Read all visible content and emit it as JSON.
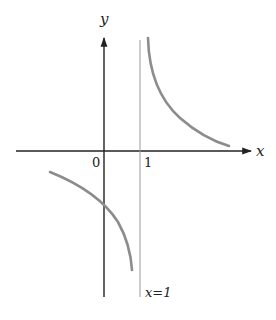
{
  "figure": {
    "axes": {
      "x_label": "x",
      "y_label": "y",
      "origin_label": "0",
      "tick_labels": [
        "1"
      ]
    },
    "asymptote": {
      "label": "x=1",
      "x": 1
    },
    "curve": {
      "description": "Hyperbola-like graph with vertical asymptote x = 1; right branch decreasing toward x-axis for x>1, left branch decreasing to -infinity as x approaches 1 from left",
      "color": "#8c8c8c"
    },
    "colors": {
      "axis": "#222222",
      "asymptote": "#9a9a9a",
      "curve": "#8c8c8c",
      "background": "#ffffff"
    }
  }
}
